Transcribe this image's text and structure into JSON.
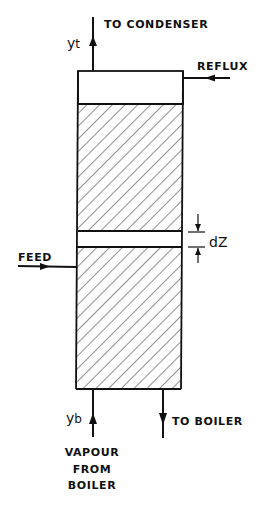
{
  "diagram": {
    "type": "packed distillation column schematic",
    "colors": {
      "line": "#111111",
      "hatch": "#555555",
      "background": "#ffffff"
    },
    "column": {
      "sections": [
        "top-disengaging-space",
        "upper-packed-section",
        "differential-element",
        "lower-packed-section"
      ]
    },
    "labels": {
      "to_condenser": "TO CONDENSER",
      "reflux": "REFLUX",
      "feed": "FEED",
      "dz": "dZ",
      "to_boiler": "TO BOILER",
      "vapour_line1": "VAPOUR",
      "vapour_line2": "FROM",
      "vapour_line3": "BOILER"
    },
    "symbols": {
      "y_top": "y",
      "y_top_sub": "t",
      "y_bottom": "y",
      "y_bottom_sub": "b"
    }
  }
}
